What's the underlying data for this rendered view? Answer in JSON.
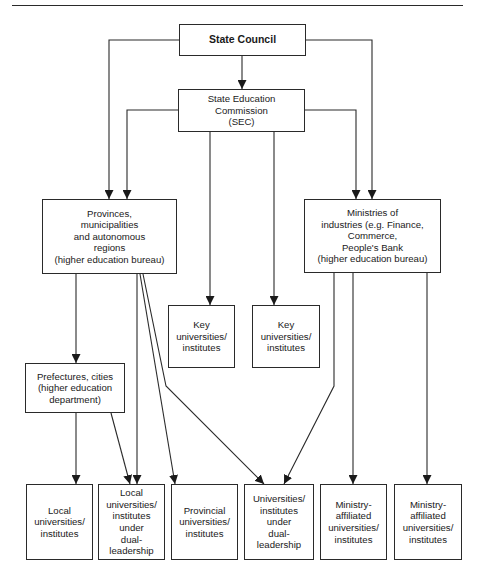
{
  "diagram": {
    "title": "",
    "nodes": {
      "state_council": {
        "label": "State Council"
      },
      "sec": {
        "label": "State Education\nCommission\n(SEC)"
      },
      "provinces": {
        "label": "Provinces,\nmunicipalities\nand autonomous\nregions\n(higher education bureau)"
      },
      "ministries": {
        "label": "Ministries of\nindustries (e.g. Finance,\nCommerce,\nPeople's Bank\n(higher education bureau)"
      },
      "key1": {
        "label": "Key\nuniversities/\ninstitutes"
      },
      "key2": {
        "label": "Key\nuniversities/\ninstitutes"
      },
      "prefectures": {
        "label": "Prefectures, cities\n(higher education\ndepartment)"
      },
      "local": {
        "label": "Local\nuniversities/\ninstitutes"
      },
      "local_dual": {
        "label": "Local\nuniversities/\ninstitutes\nunder\ndual-\nleadership"
      },
      "provincial": {
        "label": "Provincial\nuniversities/\ninstitutes"
      },
      "univ_dual": {
        "label": "Universities/\ninstitutes\nunder\ndual-\nleadership"
      },
      "ministry_aff1": {
        "label": "Ministry-\naffiliated\nuniversities/\ninstitutes"
      },
      "ministry_aff2": {
        "label": "Ministry-\naffiliated\nuniversities/\ninstitutes"
      }
    },
    "edges": [
      {
        "from": "State Council",
        "to": "State Education Commission (SEC)"
      },
      {
        "from": "State Council",
        "to": "Provinces, municipalities and autonomous regions"
      },
      {
        "from": "State Council",
        "to": "Ministries of industries"
      },
      {
        "from": "State Education Commission (SEC)",
        "to": "Provinces, municipalities and autonomous regions"
      },
      {
        "from": "State Education Commission (SEC)",
        "to": "Ministries of industries"
      },
      {
        "from": "State Education Commission (SEC)",
        "to": "Key universities/institutes (1)"
      },
      {
        "from": "State Education Commission (SEC)",
        "to": "Key universities/institutes (2)"
      },
      {
        "from": "Provinces, municipalities and autonomous regions",
        "to": "Prefectures, cities"
      },
      {
        "from": "Provinces, municipalities and autonomous regions",
        "to": "Local universities/institutes under dual-leadership"
      },
      {
        "from": "Provinces, municipalities and autonomous regions",
        "to": "Provincial universities/institutes"
      },
      {
        "from": "Provinces, municipalities and autonomous regions",
        "to": "Universities/institutes under dual-leadership"
      },
      {
        "from": "Prefectures, cities",
        "to": "Local universities/institutes"
      },
      {
        "from": "Prefectures, cities",
        "to": "Local universities/institutes under dual-leadership"
      },
      {
        "from": "Ministries of industries",
        "to": "Universities/institutes under dual-leadership"
      },
      {
        "from": "Ministries of industries",
        "to": "Ministry-affiliated universities/institutes (1)"
      },
      {
        "from": "Ministries of industries",
        "to": "Ministry-affiliated universities/institutes (2)"
      }
    ],
    "colors": {
      "line": "#2a2a2a",
      "background": "#ffffff"
    }
  }
}
